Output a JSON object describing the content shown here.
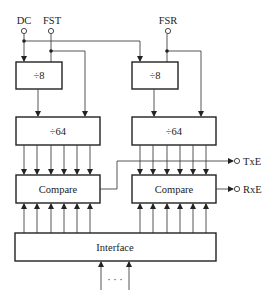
{
  "diagram": {
    "inputs": {
      "dc": "DC",
      "fst": "FST",
      "fsr": "FSR"
    },
    "blocks": {
      "div8_left": "÷8",
      "div8_right": "÷8",
      "div64_left": "÷64",
      "div64_right": "÷64",
      "compare_left": "Compare",
      "compare_right": "Compare",
      "interface": "Interface"
    },
    "outputs": {
      "txe": "TxE",
      "rxe": "RxE"
    },
    "bus_ellipsis": "· · ·",
    "colors": {
      "line": "#222222",
      "background": "#ffffff"
    }
  }
}
